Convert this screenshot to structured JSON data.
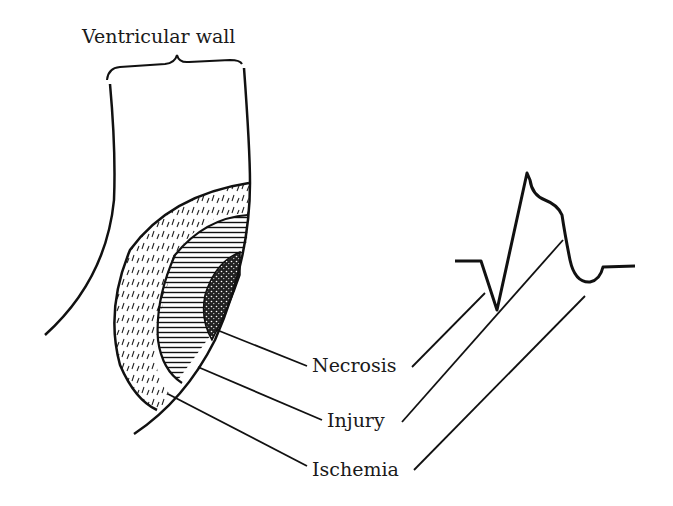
{
  "diagram": {
    "title_label": "Ventricular wall",
    "zones": [
      {
        "name": "necrosis",
        "label": "Necrosis",
        "pattern": "dense-dark"
      },
      {
        "name": "injury",
        "label": "Injury",
        "pattern": "horizontal-lines"
      },
      {
        "name": "ischemia",
        "label": "Ischemia",
        "pattern": "dashes"
      }
    ],
    "ecg_waveform": {
      "features": [
        "Q wave",
        "R wave",
        "ST elevation",
        "inverted T wave"
      ],
      "mapping": {
        "Necrosis": "Q wave",
        "Injury": "ST segment",
        "Ischemia": "T wave"
      }
    },
    "colors": {
      "ink": "#111111",
      "background": "#ffffff"
    }
  }
}
